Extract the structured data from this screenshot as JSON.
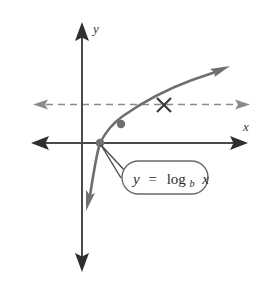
{
  "figure": {
    "background_color": "#ffffff",
    "axes": {
      "x_label": "x",
      "y_label": "y",
      "axis_color": "#4a4a4a",
      "origin_px": [
        82,
        143
      ]
    },
    "curve": {
      "label": "y = log_b x",
      "color": "#6f6f6f",
      "description": "increasing logarithmic curve with vertical asymptote at the y-axis"
    },
    "dashed_line": {
      "color": "#8a8a8a",
      "description": "horizontal double-headed dashed line crossing the curve"
    },
    "markers": {
      "cross_label": "×",
      "dot_color": "#6f6f6f",
      "points": [
        {
          "name": "x-intercept-dot",
          "px": [
            100,
            143
          ]
        },
        {
          "name": "curve-dot",
          "px": [
            121,
            124
          ]
        },
        {
          "name": "intersection-cross",
          "px": [
            164,
            105
          ]
        }
      ]
    },
    "callout": {
      "equation": {
        "lhs": "y",
        "operator": "=",
        "function": "log",
        "base": "b",
        "argument": "x"
      },
      "full_text": "y = log_b x",
      "border_color": "#6a6a6a",
      "fill_color": "#ffffff"
    }
  }
}
